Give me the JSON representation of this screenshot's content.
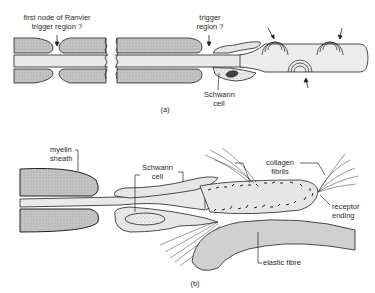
{
  "figure": {
    "title_partial": "",
    "panel_a": {
      "caption": "(a)",
      "labels": {
        "first_node_line1": "first node of Ranvier",
        "first_node_line2": "trigger region ?",
        "trigger_line1": "trigger",
        "trigger_line2": "region ?",
        "schwann_line1": "Schwann",
        "schwann_line2": "cell"
      }
    },
    "panel_b": {
      "caption": "(b)",
      "labels": {
        "myelin_line1": "myelin",
        "myelin_line2": "sheath",
        "schwann_line1": "Schwann",
        "schwann_line2": "cell",
        "collagen_line1": "collagen",
        "collagen_line2": "fibrils",
        "receptor_line1": "receptor",
        "receptor_line2": "ending",
        "elastic": "elastic fibre"
      }
    },
    "colors": {
      "myelin_fill": "#bdbdbd",
      "axon_fill": "#e6e6e6",
      "ink": "#222222",
      "elastic_fill": "#d0d0d0"
    }
  }
}
